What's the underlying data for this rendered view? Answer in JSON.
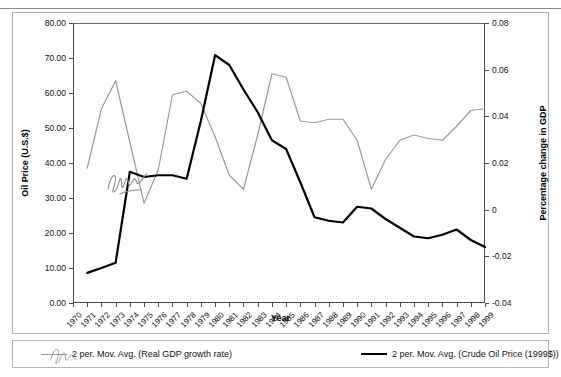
{
  "chart_data": {
    "type": "line",
    "title": "",
    "xlabel": "Year",
    "ylabel": "Oil Price (U.S.$)",
    "ylabel_right": "Percentage change in GDP",
    "ylim": [
      0,
      80
    ],
    "ylim_right": [
      -0.04,
      0.08
    ],
    "ytick_labels": [
      "80.00",
      "70.00",
      "60.00",
      "50.00",
      "40.00",
      "30.00",
      "20.00",
      "10.00",
      "0.00"
    ],
    "ytick_values": [
      80,
      70,
      60,
      50,
      40,
      30,
      20,
      10,
      0
    ],
    "ytick_labels_right": [
      "0.08",
      "0.06",
      "0.04",
      "0.02",
      "0",
      "-0.02",
      "-0.04"
    ],
    "ytick_values_right": [
      0.08,
      0.06,
      0.04,
      0.02,
      0,
      -0.02,
      -0.04
    ],
    "grid": false,
    "legend_position": "bottom",
    "categories": [
      "1970",
      "1971",
      "1972",
      "1973",
      "1974",
      "1975",
      "1976",
      "1977",
      "1978",
      "1979",
      "1980",
      "1981",
      "1982",
      "1983",
      "1984",
      "1985",
      "1986",
      "1987",
      "1988",
      "1989",
      "1990",
      "1991",
      "1992",
      "1993",
      "1994",
      "1995",
      "1996",
      "1997",
      "1998",
      "1999"
    ],
    "series": [
      {
        "name": "2 per. Mov. Avg. (Real GDP growth rate)",
        "color": "#9a9a9a",
        "axis": "right",
        "x": [
          "1971",
          "1972",
          "1973",
          "1974",
          "1975",
          "1976",
          "1977",
          "1978",
          "1979",
          "1980",
          "1981",
          "1982",
          "1983",
          "1984",
          "1985",
          "1986",
          "1987",
          "1988",
          "1989",
          "1990",
          "1991",
          "1992",
          "1993",
          "1994",
          "1995",
          "1996",
          "1997",
          "1998",
          "1999"
        ],
        "values_left_scale": [
          38.5,
          55.5,
          63.5,
          46.0,
          28.5,
          38.0,
          59.5,
          60.5,
          57.0,
          47.5,
          36.5,
          32.5,
          48.0,
          65.5,
          64.5,
          52.0,
          51.5,
          52.5,
          52.5,
          46.5,
          32.5,
          41.0,
          46.5,
          48.0,
          47.0,
          46.5,
          50.5,
          55.0,
          55.5
        ],
        "values": [
          0.0178,
          0.0433,
          0.0552,
          0.029,
          0.0028,
          0.017,
          0.0493,
          0.0508,
          0.0455,
          0.0313,
          0.0148,
          0.0088,
          0.032,
          0.0583,
          0.0568,
          0.038,
          0.0373,
          0.0388,
          0.0388,
          0.0298,
          0.0088,
          0.0215,
          0.0298,
          0.032,
          0.0305,
          0.0298,
          0.0358,
          0.0425,
          0.0433
        ]
      },
      {
        "name": "2 per. Mov. Avg. (Crude Oil Price (1999$))",
        "color": "#000000",
        "axis": "left",
        "x": [
          "1971",
          "1972",
          "1973",
          "1974",
          "1975",
          "1976",
          "1977",
          "1978",
          "1979",
          "1980",
          "1981",
          "1982",
          "1983",
          "1984",
          "1985",
          "1986",
          "1987",
          "1988",
          "1989",
          "1990",
          "1991",
          "1992",
          "1993",
          "1994",
          "1995",
          "1996",
          "1997",
          "1998",
          "1999"
        ],
        "values": [
          8.6,
          10.0,
          11.5,
          37.5,
          36.0,
          36.5,
          36.5,
          35.5,
          52.0,
          70.8,
          68.0,
          61.0,
          54.5,
          46.5,
          44.0,
          34.5,
          24.5,
          23.5,
          23.0,
          27.5,
          27.0,
          24.0,
          21.5,
          19.0,
          18.5,
          19.5,
          21.0,
          18.0,
          16.0
        ]
      }
    ]
  },
  "legend": {
    "entries": [
      {
        "label": "2 per. Mov. Avg. (Real GDP growth rate)",
        "color": "#9a9a9a"
      },
      {
        "label": "2 per. Mov. Avg. (Crude Oil Price (1999$))",
        "color": "#000000"
      }
    ]
  },
  "axes": {
    "left_title": "Oil Price (U.S.$)",
    "right_title": "Percentage change in GDP",
    "x_title": "Year"
  }
}
